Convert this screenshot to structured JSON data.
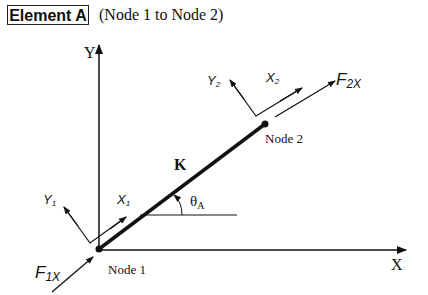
{
  "header": {
    "element_label": "Element A",
    "subtitle": "(Node 1 to Node 2)"
  },
  "axes": {
    "x_label": "X",
    "y_label": "Y"
  },
  "element": {
    "stiffness_label": "K",
    "angle_label": "θ",
    "angle_sub": "A"
  },
  "nodes": {
    "node1": {
      "label": "Node 1"
    },
    "node2": {
      "label": "Node 2"
    }
  },
  "local_axes": {
    "x1": {
      "base": "X",
      "sub": "1"
    },
    "y1": {
      "base": "Y",
      "sub": "1"
    },
    "x2": {
      "base": "X",
      "sub": "2"
    },
    "y2": {
      "base": "Y",
      "sub": "2"
    }
  },
  "forces": {
    "f1x": {
      "base": "F",
      "sub": "1X"
    },
    "f2x": {
      "base": "F",
      "sub": "2X"
    }
  },
  "colors": {
    "stroke": "#111111",
    "background": "#ffffff"
  }
}
